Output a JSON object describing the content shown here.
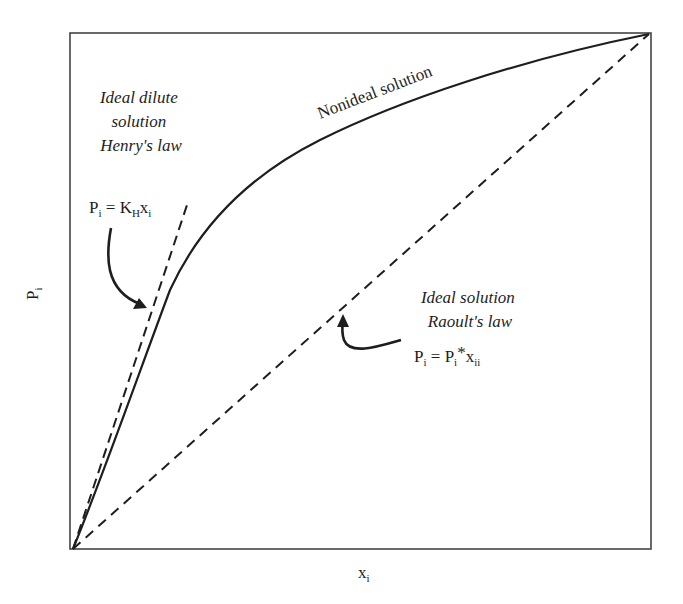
{
  "diagram": {
    "type": "line",
    "axes": {
      "x_label": {
        "base": "x",
        "sub": "i"
      },
      "y_label": {
        "base": "P",
        "sub": "i"
      }
    },
    "curves": {
      "nonideal": {
        "label": "Nonideal solution",
        "style": "solid"
      },
      "henry": {
        "style": "dashed"
      },
      "raoult": {
        "style": "dashed"
      }
    },
    "annotations": {
      "henry": {
        "title_lines": [
          "Ideal dilute",
          "solution",
          "Henry's law"
        ],
        "equation": {
          "p": "P",
          "p_sub": "i",
          "eq": " = ",
          "k": "K",
          "k_sub": "H",
          "x": "x",
          "x_sub": "i"
        }
      },
      "raoult": {
        "title_lines": [
          "Ideal solution",
          "Raoult's law"
        ],
        "equation": {
          "p": "P",
          "p_sub": "i",
          "eq": " = ",
          "p2": "P",
          "p2_sub": "i",
          "star": "*",
          "x": "x",
          "x_sub": "ii"
        }
      }
    },
    "colors": {
      "line": "#1e1e1e",
      "frame": "#444444",
      "background": "#ffffff"
    }
  }
}
